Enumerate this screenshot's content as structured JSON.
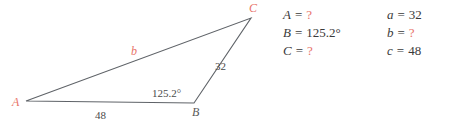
{
  "figure": {
    "name": "triangle-ABC",
    "vertices": [
      {
        "id": "A",
        "label": "A",
        "x": 26,
        "y": 101,
        "color": "#e8736a"
      },
      {
        "id": "B",
        "label": "B",
        "x": 194,
        "y": 103,
        "color": "#5a5a5a"
      },
      {
        "id": "C",
        "label": "C",
        "x": 251,
        "y": 18,
        "color": "#e8736a"
      }
    ],
    "sides": [
      {
        "id": "c",
        "label": "48",
        "from": "A",
        "to": "B",
        "color": "#4a4a4a"
      },
      {
        "id": "a",
        "label": "32",
        "from": "B",
        "to": "C",
        "color": "#4a4a4a"
      },
      {
        "id": "b",
        "label": "b",
        "from": "A",
        "to": "C",
        "color": "#e8736a"
      }
    ],
    "angles": [
      {
        "at": "B",
        "label": "125.2°",
        "color": "#4a4a4a"
      }
    ],
    "stroke_color": "#5f6368"
  },
  "equations": {
    "rows": [
      {
        "angle": {
          "var": "A",
          "eq": "=",
          "value": "?",
          "unknown": true
        },
        "side": {
          "var": "a",
          "eq": "=",
          "value": "32",
          "unknown": false
        }
      },
      {
        "angle": {
          "var": "B",
          "eq": "=",
          "value": "125.2°",
          "unknown": false
        },
        "side": {
          "var": "b",
          "eq": "=",
          "value": "?",
          "unknown": true
        }
      },
      {
        "angle": {
          "var": "C",
          "eq": "=",
          "value": "?",
          "unknown": true
        },
        "side": {
          "var": "c",
          "eq": "=",
          "value": "48",
          "unknown": false
        }
      }
    ]
  },
  "colors": {
    "unknown": "#e8736a",
    "text": "#3a3a3a",
    "line": "#5f6368"
  }
}
